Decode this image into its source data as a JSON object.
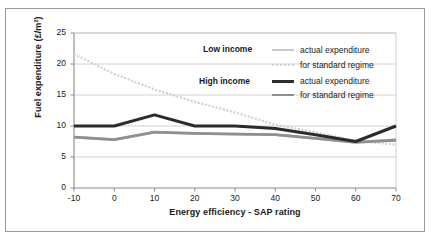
{
  "figure": {
    "clipped_caption_above": "",
    "frame_color": "#9a9a9a",
    "background": "#ffffff"
  },
  "axes": {
    "y_title": "Fuel expenditure (£/m²)",
    "x_title": "Energy efficiency - SAP rating",
    "y_ticks": [
      "0",
      "5",
      "10",
      "15",
      "20",
      "25"
    ],
    "x_ticks": [
      "-10",
      "0",
      "10",
      "20",
      "30",
      "40",
      "50",
      "60",
      "70"
    ]
  },
  "groups": [
    {
      "label": "Low income"
    },
    {
      "label": "High income"
    }
  ],
  "legend": {
    "rows": [
      {
        "text": "actual expenditure",
        "color": "#c9c9c9",
        "style": "solid",
        "width": 2.6
      },
      {
        "text": "for standard regime",
        "color": "#d2d2d2",
        "style": "dotted",
        "width": 2.2
      },
      {
        "text": "actual expenditure",
        "color": "#2b2b2b",
        "style": "solid",
        "width": 3.0
      },
      {
        "text": "for standard regime",
        "color": "#8f8f8f",
        "style": "solid",
        "width": 2.8
      }
    ]
  },
  "chart_data": {
    "type": "line",
    "title": "",
    "xlabel": "Energy efficiency - SAP rating",
    "ylabel": "Fuel expenditure (£/m²)",
    "xlim": [
      -10,
      70
    ],
    "ylim": [
      0,
      25
    ],
    "x_ticks": [
      -10,
      0,
      10,
      20,
      30,
      40,
      50,
      60,
      70
    ],
    "y_ticks": [
      0,
      5,
      10,
      15,
      20,
      25
    ],
    "grid": "horizontal",
    "legend_position": "inside-top-right",
    "x": [
      -10,
      0,
      10,
      20,
      30,
      40,
      50,
      60,
      70
    ],
    "series": [
      {
        "name": "Low income - actual expenditure",
        "group": "Low income",
        "color": "#c9c9c9",
        "style": "solid",
        "width": 2.6,
        "values": [
          8.2,
          7.8,
          9.0,
          8.8,
          8.7,
          8.6,
          8.0,
          7.3,
          7.8
        ]
      },
      {
        "name": "Low income - for standard regime",
        "group": "Low income",
        "color": "#d2d2d2",
        "style": "dotted",
        "width": 2.2,
        "values": [
          21.6,
          18.4,
          15.9,
          13.9,
          12.2,
          10.2,
          9.0,
          7.6,
          7.0
        ]
      },
      {
        "name": "High income - actual expenditure",
        "group": "High income",
        "color": "#2b2b2b",
        "style": "solid",
        "width": 3.0,
        "values": [
          10.0,
          10.0,
          11.8,
          10.0,
          10.0,
          9.6,
          8.6,
          7.5,
          10.0
        ]
      },
      {
        "name": "High income - for standard regime",
        "group": "High income",
        "color": "#8f8f8f",
        "style": "solid",
        "width": 2.8,
        "values": [
          8.2,
          7.8,
          9.0,
          8.8,
          8.7,
          8.6,
          8.0,
          7.4,
          7.7
        ]
      }
    ]
  }
}
